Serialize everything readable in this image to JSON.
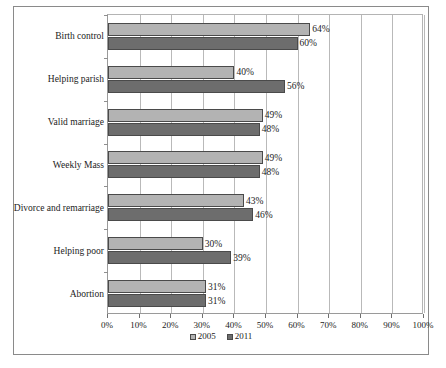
{
  "chart_data": {
    "type": "bar",
    "orientation": "horizontal",
    "title": "",
    "xlabel": "",
    "ylabel": "",
    "xlim": [
      0,
      100
    ],
    "grid": true,
    "legend_position": "bottom",
    "categories": [
      "Birth control",
      "Helping parish",
      "Valid marriage",
      "Weekly Mass",
      "Divorce and remarriage",
      "Helping poor",
      "Abortion"
    ],
    "tick_labels": [
      "0%",
      "10%",
      "20%",
      "30%",
      "40%",
      "50%",
      "60%",
      "70%",
      "80%",
      "90%",
      "100%"
    ],
    "tick_values": [
      0,
      10,
      20,
      30,
      40,
      50,
      60,
      70,
      80,
      90,
      100
    ],
    "series": [
      {
        "name": "2005",
        "color": "#b3b3b3",
        "values": [
          64,
          40,
          49,
          49,
          43,
          30,
          31
        ],
        "value_labels": [
          "64%",
          "40%",
          "49%",
          "49%",
          "43%",
          "30%",
          "31%"
        ]
      },
      {
        "name": "2011",
        "color": "#6d6d6d",
        "values": [
          60,
          56,
          48,
          48,
          46,
          39,
          31
        ],
        "value_labels": [
          "60%",
          "56%",
          "48%",
          "48%",
          "46%",
          "39%",
          "31%"
        ]
      }
    ]
  }
}
